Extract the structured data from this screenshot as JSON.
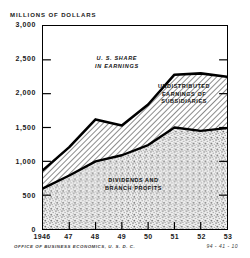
{
  "chart_data": {
    "type": "area",
    "title": "MILLIONS OF DOLLARS",
    "subtitle": "",
    "xlabel": "",
    "ylabel": "MILLIONS OF DOLLARS",
    "x": [
      1946,
      1947,
      1948,
      1949,
      1950,
      1951,
      1952,
      1953
    ],
    "categories": [
      "1946",
      "47",
      "48",
      "49",
      "50",
      "51",
      "52",
      "53"
    ],
    "ylim": [
      0,
      3000
    ],
    "xlim": [
      1946,
      1953
    ],
    "yticks": [
      0,
      500,
      1000,
      1500,
      2000,
      2500,
      3000
    ],
    "ytick_labels": [
      "0",
      "500",
      "1,000",
      "1,500",
      "2,000",
      "2,500",
      "3,000"
    ],
    "grid": false,
    "legend": "in-plot annotations",
    "stacked": true,
    "series": [
      {
        "name": "DIVIDENDS AND BRANCH PROFITS",
        "fill": "stipple",
        "values": [
          600,
          790,
          1000,
          1090,
          1240,
          1500,
          1450,
          1490
        ]
      },
      {
        "name": "UNDISTRIBUTED EARNINGS OF SUBSIDIARIES",
        "fill": "hatch",
        "values": [
          270,
          420,
          620,
          440,
          600,
          780,
          850,
          760
        ]
      }
    ],
    "cumulative_total": {
      "name": "U. S. SHARE IN EARNINGS",
      "values": [
        870,
        1210,
        1620,
        1530,
        1840,
        2280,
        2300,
        2250
      ]
    },
    "annotations": [
      {
        "id": "total-label",
        "text_lines": [
          "U. S. SHARE",
          "IN EARNINGS"
        ]
      },
      {
        "id": "undistributed-label",
        "text_lines": [
          "UNDISTRIBUTED",
          "EARNINGS OF",
          "SUBSIDIARIES"
        ]
      },
      {
        "id": "dividends-label",
        "text_lines": [
          "DIVIDENDS AND",
          "BRANCH PROFITS"
        ]
      }
    ],
    "colors": {
      "line": "#000000",
      "frame": "#000000",
      "hatch": "#2b2b2b",
      "stipple": "#6e6e6e",
      "background": "#ffffff"
    }
  },
  "footer": {
    "source": "OFFICE OF BUSINESS ECONOMICS, U. S. D. C.",
    "code": "94 - 41 - 10"
  }
}
